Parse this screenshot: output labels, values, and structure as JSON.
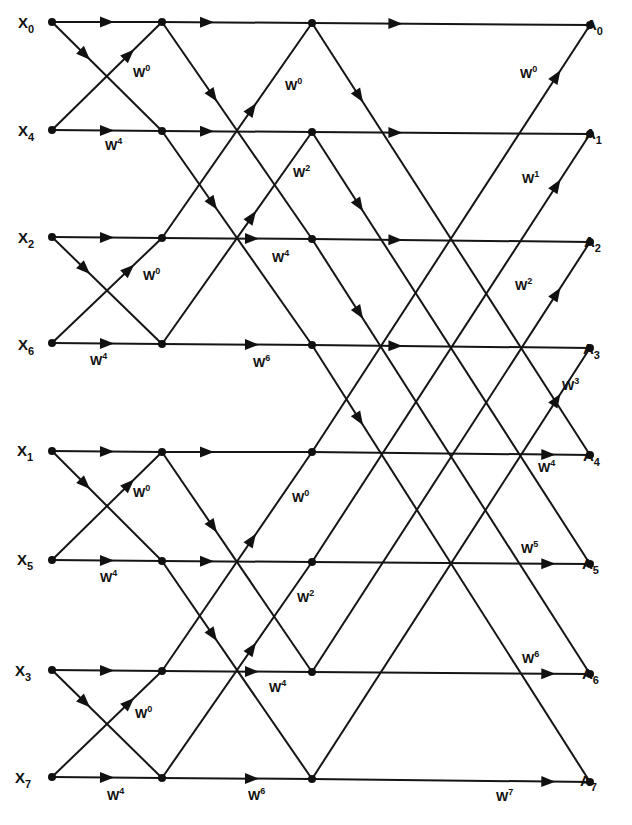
{
  "inputs": [
    {
      "base": "X",
      "index": "0"
    },
    {
      "base": "X",
      "index": "4"
    },
    {
      "base": "X",
      "index": "2"
    },
    {
      "base": "X",
      "index": "6"
    },
    {
      "base": "X",
      "index": "1"
    },
    {
      "base": "X",
      "index": "5"
    },
    {
      "base": "X",
      "index": "3"
    },
    {
      "base": "X",
      "index": "7"
    }
  ],
  "outputs": [
    {
      "base": "A",
      "index": "0"
    },
    {
      "base": "A",
      "index": "1"
    },
    {
      "base": "A",
      "index": "2"
    },
    {
      "base": "A",
      "index": "3"
    },
    {
      "base": "A",
      "index": "4"
    },
    {
      "base": "A",
      "index": "5"
    },
    {
      "base": "A",
      "index": "6"
    },
    {
      "base": "A",
      "index": "7"
    }
  ],
  "stages": [
    {
      "name": "stage-1",
      "twiddles": [
        {
          "base": "W",
          "exp": "0",
          "x": 133,
          "y": 77
        },
        {
          "base": "W",
          "exp": "4",
          "x": 105,
          "y": 150
        },
        {
          "base": "W",
          "exp": "0",
          "x": 143,
          "y": 280
        },
        {
          "base": "W",
          "exp": "4",
          "x": 90,
          "y": 365
        },
        {
          "base": "W",
          "exp": "0",
          "x": 133,
          "y": 497
        },
        {
          "base": "W",
          "exp": "4",
          "x": 100,
          "y": 582
        },
        {
          "base": "W",
          "exp": "0",
          "x": 135,
          "y": 718
        },
        {
          "base": "W",
          "exp": "4",
          "x": 107,
          "y": 800
        }
      ]
    },
    {
      "name": "stage-2",
      "twiddles": [
        {
          "base": "W",
          "exp": "0",
          "x": 285,
          "y": 90
        },
        {
          "base": "W",
          "exp": "2",
          "x": 293,
          "y": 177
        },
        {
          "base": "W",
          "exp": "4",
          "x": 272,
          "y": 262
        },
        {
          "base": "W",
          "exp": "6",
          "x": 253,
          "y": 367
        },
        {
          "base": "W",
          "exp": "0",
          "x": 292,
          "y": 502
        },
        {
          "base": "W",
          "exp": "2",
          "x": 297,
          "y": 602
        },
        {
          "base": "W",
          "exp": "4",
          "x": 269,
          "y": 692
        },
        {
          "base": "W",
          "exp": "6",
          "x": 248,
          "y": 800
        }
      ]
    },
    {
      "name": "stage-3",
      "twiddles": [
        {
          "base": "W",
          "exp": "0",
          "x": 520,
          "y": 78
        },
        {
          "base": "W",
          "exp": "1",
          "x": 522,
          "y": 183
        },
        {
          "base": "W",
          "exp": "2",
          "x": 515,
          "y": 290
        },
        {
          "base": "W",
          "exp": "3",
          "x": 562,
          "y": 390
        },
        {
          "base": "W",
          "exp": "4",
          "x": 538,
          "y": 472
        },
        {
          "base": "W",
          "exp": "5",
          "x": 521,
          "y": 553
        },
        {
          "base": "W",
          "exp": "6",
          "x": 522,
          "y": 663
        },
        {
          "base": "W",
          "exp": "7",
          "x": 496,
          "y": 801
        }
      ]
    }
  ],
  "colors": {
    "line": "#151515",
    "background": "#ffffff"
  }
}
